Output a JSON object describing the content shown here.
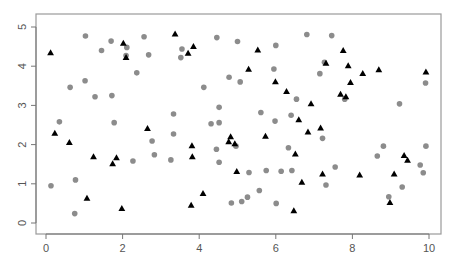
{
  "chart_data": {
    "type": "scatter",
    "title": "",
    "xlabel": "",
    "ylabel": "",
    "xlim": [
      -0.25,
      10.3
    ],
    "ylim": [
      -0.28,
      5.27
    ],
    "x_ticks": [
      0,
      2,
      4,
      6,
      8,
      10
    ],
    "y_ticks": [
      0,
      1,
      2,
      3,
      4,
      5
    ],
    "grid": false,
    "legend": null,
    "colors": {
      "circle": "#8c8c8c",
      "triangle": "#000000",
      "frame": "#9a9a9a",
      "axis": "#777777"
    },
    "series": [
      {
        "name": "triangles",
        "marker": "triangle",
        "points": [
          [
            0.12,
            4.34
          ],
          [
            2.02,
            4.58
          ],
          [
            2.09,
            4.22
          ],
          [
            3.37,
            4.82
          ],
          [
            3.85,
            4.5
          ],
          [
            3.71,
            4.33
          ],
          [
            5.53,
            4.41
          ],
          [
            5.29,
            3.92
          ],
          [
            5.99,
            3.6
          ],
          [
            7.76,
            4.4
          ],
          [
            7.31,
            4.07
          ],
          [
            7.89,
            4.01
          ],
          [
            8.27,
            3.81
          ],
          [
            8.69,
            3.91
          ],
          [
            9.92,
            3.85
          ],
          [
            7.95,
            3.58
          ],
          [
            0.23,
            2.29
          ],
          [
            2.65,
            2.41
          ],
          [
            0.61,
            2.05
          ],
          [
            1.24,
            1.69
          ],
          [
            1.84,
            1.66
          ],
          [
            1.74,
            1.51
          ],
          [
            6.28,
            3.35
          ],
          [
            6.6,
            2.63
          ],
          [
            4.82,
            2.2
          ],
          [
            4.77,
            2.07
          ],
          [
            4.93,
            2.02
          ],
          [
            5.73,
            2.21
          ],
          [
            6.84,
            2.32
          ],
          [
            3.81,
            1.97
          ],
          [
            6.51,
            1.76
          ],
          [
            3.82,
            1.69
          ],
          [
            7.69,
            3.28
          ],
          [
            7.83,
            3.22
          ],
          [
            6.92,
            3.04
          ],
          [
            7.17,
            2.42
          ],
          [
            9.35,
            1.72
          ],
          [
            9.44,
            1.6
          ],
          [
            1.07,
            0.63
          ],
          [
            1.98,
            0.37
          ],
          [
            4.98,
            1.31
          ],
          [
            6.68,
            1.04
          ],
          [
            4.1,
            0.75
          ],
          [
            3.79,
            0.45
          ],
          [
            6.47,
            0.31
          ],
          [
            7.22,
            1.25
          ],
          [
            8.19,
            1.22
          ],
          [
            9.09,
            1.25
          ],
          [
            8.98,
            0.52
          ]
        ]
      },
      {
        "name": "circles",
        "marker": "circle",
        "points": [
          [
            1.03,
            4.77
          ],
          [
            1.7,
            4.64
          ],
          [
            2.11,
            4.48
          ],
          [
            1.45,
            4.4
          ],
          [
            2.09,
            4.27
          ],
          [
            2.56,
            4.75
          ],
          [
            2.68,
            4.29
          ],
          [
            2.37,
            3.83
          ],
          [
            1.02,
            3.63
          ],
          [
            0.63,
            3.46
          ],
          [
            3.55,
            4.44
          ],
          [
            3.52,
            4.22
          ],
          [
            4.46,
            4.73
          ],
          [
            5.0,
            4.63
          ],
          [
            6.0,
            4.53
          ],
          [
            6.81,
            4.81
          ],
          [
            5.95,
            3.93
          ],
          [
            4.78,
            3.72
          ],
          [
            5.07,
            3.6
          ],
          [
            4.12,
            3.46
          ],
          [
            7.46,
            4.78
          ],
          [
            7.27,
            4.1
          ],
          [
            7.15,
            3.81
          ],
          [
            9.91,
            3.57
          ],
          [
            1.28,
            3.22
          ],
          [
            1.72,
            3.25
          ],
          [
            0.35,
            2.58
          ],
          [
            1.78,
            2.56
          ],
          [
            2.77,
            2.09
          ],
          [
            3.33,
            2.78
          ],
          [
            3.33,
            2.27
          ],
          [
            2.83,
            1.74
          ],
          [
            2.27,
            1.58
          ],
          [
            3.26,
            1.61
          ],
          [
            6.54,
            3.16
          ],
          [
            4.52,
            2.95
          ],
          [
            5.61,
            2.82
          ],
          [
            6.4,
            2.75
          ],
          [
            5.98,
            2.6
          ],
          [
            4.31,
            2.53
          ],
          [
            4.52,
            2.56
          ],
          [
            4.96,
            1.96
          ],
          [
            4.45,
            1.88
          ],
          [
            6.33,
            1.92
          ],
          [
            4.52,
            1.55
          ],
          [
            7.8,
            3.16
          ],
          [
            9.23,
            3.04
          ],
          [
            7.22,
            2.16
          ],
          [
            8.81,
            1.96
          ],
          [
            9.92,
            1.96
          ],
          [
            8.65,
            1.71
          ],
          [
            0.13,
            0.95
          ],
          [
            0.77,
            1.1
          ],
          [
            0.75,
            0.24
          ],
          [
            5.3,
            1.29
          ],
          [
            5.75,
            1.34
          ],
          [
            6.14,
            1.32
          ],
          [
            6.42,
            1.34
          ],
          [
            5.57,
            0.83
          ],
          [
            5.26,
            0.66
          ],
          [
            5.11,
            0.55
          ],
          [
            4.84,
            0.51
          ],
          [
            6.01,
            0.5
          ],
          [
            7.55,
            1.43
          ],
          [
            9.77,
            1.48
          ],
          [
            9.85,
            1.28
          ],
          [
            7.31,
            0.97
          ],
          [
            9.3,
            0.92
          ],
          [
            8.95,
            0.67
          ]
        ]
      }
    ]
  },
  "layout": {
    "plot_box": {
      "left": 36,
      "top": 14,
      "right": 441,
      "bottom": 234
    },
    "x_origin_px": 46,
    "x_px_per_unit": 38.3,
    "y_origin_px": 223,
    "y_px_per_unit": 39.2
  }
}
